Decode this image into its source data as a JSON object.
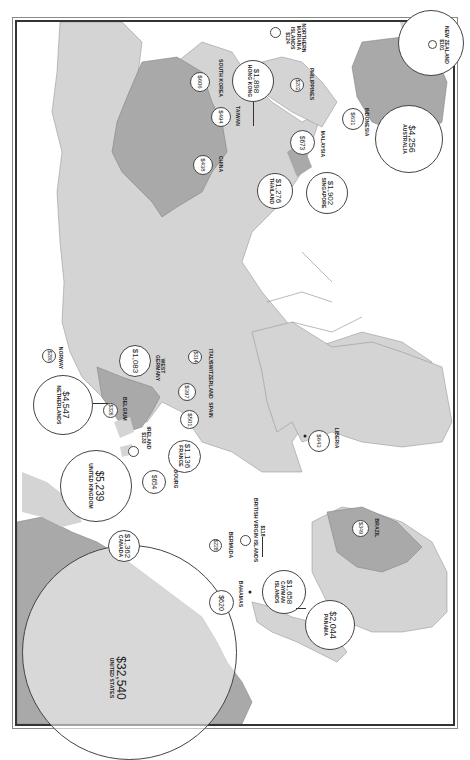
{
  "map": {
    "orientation": "rotated 90 degrees clockwise (north to the left)",
    "colors": {
      "ocean": "#ffffff",
      "land": "#d4d4d4",
      "highlight": "#a9a9a9",
      "border": "#7a7a7a",
      "frame": "#333333"
    },
    "locations": [
      {
        "id": "united-states",
        "value": "$32,540",
        "name": "UNITED STATES"
      },
      {
        "id": "canada",
        "value": "$1,362",
        "name": "CANADA"
      },
      {
        "id": "bahamas",
        "value": "$620",
        "name": "BAHAMAS"
      },
      {
        "id": "bermuda",
        "value": "$228",
        "name": "BERMUDA"
      },
      {
        "id": "british-virgin-islands",
        "value": "$118",
        "name": "BRITISH VIRGIN ISLANDS"
      },
      {
        "id": "cayman-islands",
        "value": "$1,658",
        "name": "CAYMAN ISLANDS"
      },
      {
        "id": "panama",
        "value": "$2,044",
        "name": "PANAMA"
      },
      {
        "id": "brazil",
        "value": "$349",
        "name": "BRAZIL"
      },
      {
        "id": "united-kingdom",
        "value": "$5,239",
        "name": "UNITED KINGDOM"
      },
      {
        "id": "netherlands",
        "value": "$4,547",
        "name": "NETHERLANDS"
      },
      {
        "id": "norway",
        "value": "$280",
        "name": "NORWAY"
      },
      {
        "id": "belgium",
        "value": "$326",
        "name": "BELGIUM"
      },
      {
        "id": "ireland",
        "value": "$133",
        "name": "IRELAND"
      },
      {
        "id": "luxembourg",
        "value": "$654",
        "name": "LUXEMBOURG"
      },
      {
        "id": "france",
        "value": "$1,136",
        "name": "FRANCE"
      },
      {
        "id": "west-germany",
        "value": "$1,083",
        "name": "WEST GERMANY"
      },
      {
        "id": "switzerland",
        "value": "$397",
        "name": "SWITZERLAND"
      },
      {
        "id": "spain",
        "value": "$501",
        "name": "SPAIN"
      },
      {
        "id": "italy",
        "value": "$314",
        "name": "ITALY"
      },
      {
        "id": "liberia",
        "value": "$643",
        "name": "LIBERIA"
      },
      {
        "id": "china",
        "value": "$438",
        "name": "CHINA"
      },
      {
        "id": "south-korea",
        "value": "$606",
        "name": "SOUTH KOREA"
      },
      {
        "id": "taiwan",
        "value": "$494",
        "name": "TAIWAN"
      },
      {
        "id": "hong-kong",
        "value": "$1,898",
        "name": "HONG KONG"
      },
      {
        "id": "thailand",
        "value": "$1,276",
        "name": "THAILAND"
      },
      {
        "id": "malaysia",
        "value": "$673",
        "name": "MALAYSIA"
      },
      {
        "id": "singapore",
        "value": "$1,902",
        "name": "SINGAPORE"
      },
      {
        "id": "philippines",
        "value": "$202",
        "name": "PHILIPPINES"
      },
      {
        "id": "northern-mariana-islands",
        "value": "$124",
        "name": "NORTHERN MARIANA ISLANDS"
      },
      {
        "id": "indonesia",
        "value": "$631",
        "name": "INDONESIA"
      },
      {
        "id": "australia",
        "value": "$4,256",
        "name": "AUSTRALIA"
      },
      {
        "id": "new-zealand",
        "value": "$101",
        "name": "NEW ZEALAND"
      }
    ]
  }
}
